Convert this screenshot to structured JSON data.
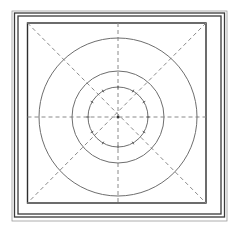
{
  "diagram": {
    "type": "concentric-circle-grid",
    "canvas": {
      "width": 234,
      "height": 235
    },
    "center": {
      "x": 118,
      "y": 117
    },
    "frame": {
      "outer_lines": [
        {
          "x": 12,
          "y": 11,
          "w": 215,
          "h": 210,
          "style": "faint"
        },
        {
          "x": 14.5,
          "y": 13,
          "w": 210,
          "h": 204,
          "style": "solid"
        },
        {
          "x": 18,
          "y": 16,
          "w": 203,
          "h": 198,
          "style": "solid"
        }
      ],
      "inner_box": {
        "x": 27.5,
        "y": 23,
        "w": 178.5,
        "h": 180
      }
    },
    "circles": [
      {
        "name": "outer-circle",
        "r": 79
      },
      {
        "name": "middle-circle",
        "r": 46
      },
      {
        "name": "inner-circle",
        "r": 30,
        "ticks": 12
      }
    ],
    "axes": {
      "horizontal": true,
      "vertical": true,
      "diagonals": true,
      "style": "dashed"
    },
    "colors": {
      "frame": "#3a3a3a",
      "circle": "#6e6e6e",
      "dashed": "#8a8a8a",
      "background": "#ffffff"
    }
  }
}
